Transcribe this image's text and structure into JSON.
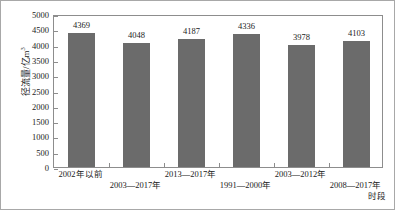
{
  "chart_data": {
    "type": "bar",
    "title": "",
    "subtitle": "",
    "xlabel": "时段",
    "ylabel": "径流量/亿m³",
    "ylabel_base": "径流量/亿m",
    "ylabel_sup": "3",
    "categories": [
      "2002年以前",
      "2003—2017年",
      "2013—2017年",
      "1991—2000年",
      "2003—2012年",
      "2008—2017年"
    ],
    "category_rows": [
      0,
      1,
      0,
      1,
      0,
      1
    ],
    "values": [
      4369,
      4048,
      4187,
      4336,
      3978,
      4103
    ],
    "value_labels": [
      "4369",
      "4048",
      "4187",
      "4336",
      "3978",
      "4103"
    ],
    "ylim": [
      0,
      5000
    ],
    "ytick_values": [
      0,
      500,
      1000,
      1500,
      2000,
      2500,
      3000,
      3500,
      4000,
      4500,
      5000
    ],
    "ytick_labels": [
      "0",
      "500",
      "1000",
      "1500",
      "2000",
      "2500",
      "3000",
      "3500",
      "4000",
      "4500",
      "5000"
    ],
    "grid": false,
    "legend": false,
    "legend_position": "none",
    "bar_color": "#6b6b6b",
    "axis_color": "#8d8d8d",
    "frame_color": "#a8a8a8",
    "text_color": "#1a1a1a"
  }
}
